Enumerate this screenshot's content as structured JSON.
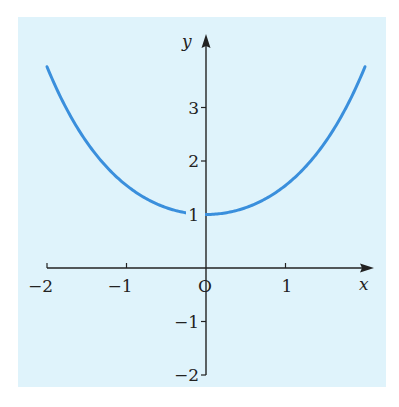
{
  "chart_data": {
    "type": "line",
    "title": "",
    "xlabel": "x",
    "ylabel": "y",
    "function": "y = cosh(x)",
    "xlim": [
      -2,
      2
    ],
    "ylim": [
      -2,
      3.76
    ],
    "x_ticks": [
      -2,
      -1,
      0,
      1
    ],
    "x_tick_labels": [
      "−2",
      "−1",
      "O",
      "1"
    ],
    "y_ticks": [
      -2,
      -1,
      1,
      2,
      3
    ],
    "y_tick_labels": [
      "−2",
      "−1",
      "1",
      "2",
      "3"
    ],
    "grid": false,
    "legend": null,
    "series": [
      {
        "name": "curve",
        "color": "#3a8fdc",
        "x": [
          -2,
          -1.5,
          -1,
          -0.5,
          0,
          0.5,
          1,
          1.5,
          2
        ],
        "y": [
          3.76,
          2.35,
          1.54,
          1.13,
          1.0,
          1.13,
          1.54,
          2.35,
          3.76
        ]
      }
    ]
  },
  "colors": {
    "background": "#dff3fb",
    "curve": "#3a8fdc",
    "axis": "#222222"
  },
  "labels": {
    "x_axis": "x",
    "y_axis": "y",
    "origin": "O"
  }
}
